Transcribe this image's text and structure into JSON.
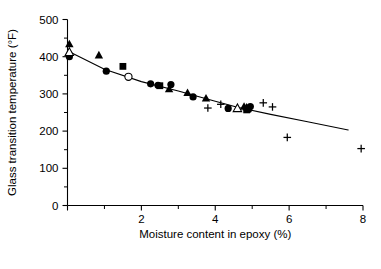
{
  "chart_data": {
    "type": "scatter",
    "title": "",
    "xlabel": "Moisture content in epoxy (%)",
    "ylabel": "Glass transition temperature (°F)",
    "xlim": [
      0,
      8
    ],
    "ylim": [
      0,
      500
    ],
    "grid": false,
    "legend": "none",
    "x_ticks_major": [
      0,
      2,
      4,
      6,
      8
    ],
    "x_ticks_minor": [
      1,
      3,
      5,
      7
    ],
    "x_tick_labels": [
      "",
      "2",
      "4",
      "6",
      "8"
    ],
    "y_ticks_major": [
      0,
      100,
      200,
      300,
      400,
      500
    ],
    "y_ticks_minor": [
      50,
      150,
      250,
      350,
      450
    ],
    "y_tick_labels": [
      "0",
      "100",
      "200",
      "300",
      "400",
      "500"
    ],
    "series": [
      {
        "name": "filled-circle",
        "marker": "filled circle",
        "points": [
          {
            "x": 0.05,
            "y": 400
          },
          {
            "x": 1.05,
            "y": 361
          },
          {
            "x": 2.25,
            "y": 327
          },
          {
            "x": 2.45,
            "y": 323
          },
          {
            "x": 2.8,
            "y": 325
          },
          {
            "x": 3.4,
            "y": 292
          },
          {
            "x": 4.35,
            "y": 261
          },
          {
            "x": 4.9,
            "y": 258
          },
          {
            "x": 4.95,
            "y": 266
          }
        ]
      },
      {
        "name": "filled-square",
        "marker": "filled square",
        "points": [
          {
            "x": 1.5,
            "y": 374
          },
          {
            "x": 2.5,
            "y": 322
          },
          {
            "x": 4.85,
            "y": 257
          }
        ]
      },
      {
        "name": "filled-triangle",
        "marker": "filled triangle",
        "points": [
          {
            "x": 0.05,
            "y": 434
          },
          {
            "x": 0.85,
            "y": 404
          },
          {
            "x": 2.75,
            "y": 313
          },
          {
            "x": 3.25,
            "y": 303
          },
          {
            "x": 3.75,
            "y": 288
          },
          {
            "x": 4.78,
            "y": 266
          },
          {
            "x": 4.85,
            "y": 264
          }
        ]
      },
      {
        "name": "open-circle",
        "marker": "open circle",
        "points": [
          {
            "x": 1.65,
            "y": 346
          }
        ]
      },
      {
        "name": "open-triangle",
        "marker": "open triangle",
        "points": [
          {
            "x": 0.05,
            "y": 412
          },
          {
            "x": 4.6,
            "y": 261
          }
        ]
      },
      {
        "name": "plus",
        "marker": "plus",
        "points": [
          {
            "x": 3.8,
            "y": 262
          },
          {
            "x": 4.15,
            "y": 272
          },
          {
            "x": 5.3,
            "y": 276
          },
          {
            "x": 5.55,
            "y": 265
          },
          {
            "x": 5.95,
            "y": 183
          },
          {
            "x": 7.95,
            "y": 153
          }
        ]
      }
    ],
    "trend_line": {
      "name": "fitted curve",
      "points": [
        {
          "x": 0.05,
          "y": 413
        },
        {
          "x": 1.0,
          "y": 366
        },
        {
          "x": 2.0,
          "y": 333
        },
        {
          "x": 3.0,
          "y": 308
        },
        {
          "x": 4.0,
          "y": 280
        },
        {
          "x": 4.6,
          "y": 264
        },
        {
          "x": 5.5,
          "y": 245
        },
        {
          "x": 6.5,
          "y": 225
        },
        {
          "x": 7.6,
          "y": 203
        }
      ]
    }
  }
}
